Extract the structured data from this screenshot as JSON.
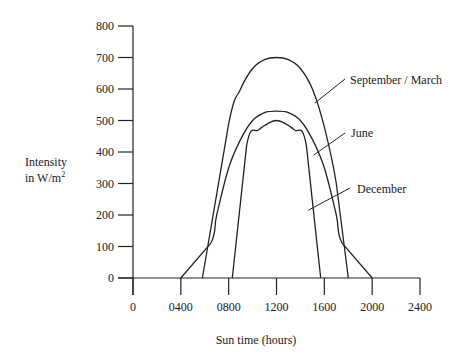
{
  "chart_data": {
    "type": "line",
    "title": "",
    "xlabel": "Sun time (hours)",
    "ylabel_line1": "Intensity",
    "ylabel_line2": "in W/m",
    "ylabel_superscript": "2",
    "xlim": [
      0,
      2400
    ],
    "ylim": [
      0,
      800
    ],
    "x_ticks": [
      0,
      400,
      800,
      1200,
      1600,
      2000,
      2400
    ],
    "x_tick_labels": [
      "0",
      "0400",
      "0800",
      "1200",
      "1600",
      "2000",
      "2400"
    ],
    "y_ticks": [
      0,
      100,
      200,
      300,
      400,
      500,
      600,
      700,
      800
    ],
    "y_tick_labels": [
      "0",
      "100",
      "200",
      "300",
      "400",
      "500",
      "600",
      "700",
      "800"
    ],
    "grid": false,
    "legend": "inline labels with leader lines, right side",
    "series": [
      {
        "name": "September / March",
        "points": [
          [
            580,
            0
          ],
          [
            800,
            490
          ],
          [
            900,
            600
          ],
          [
            1000,
            665
          ],
          [
            1100,
            693
          ],
          [
            1200,
            700
          ],
          [
            1300,
            693
          ],
          [
            1400,
            665
          ],
          [
            1500,
            600
          ],
          [
            1600,
            480
          ],
          [
            1700,
            300
          ],
          [
            1800,
            0
          ]
        ]
      },
      {
        "name": "June",
        "points": [
          [
            400,
            0
          ],
          [
            650,
            110
          ],
          [
            700,
            200
          ],
          [
            800,
            350
          ],
          [
            900,
            440
          ],
          [
            1000,
            500
          ],
          [
            1100,
            525
          ],
          [
            1200,
            530
          ],
          [
            1300,
            525
          ],
          [
            1400,
            500
          ],
          [
            1500,
            440
          ],
          [
            1600,
            350
          ],
          [
            1700,
            200
          ],
          [
            1750,
            110
          ],
          [
            2000,
            0
          ]
        ]
      },
      {
        "name": "December",
        "points": [
          [
            830,
            0
          ],
          [
            950,
            420
          ],
          [
            1050,
            470
          ],
          [
            1150,
            495
          ],
          [
            1200,
            500
          ],
          [
            1250,
            495
          ],
          [
            1350,
            470
          ],
          [
            1450,
            420
          ],
          [
            1570,
            0
          ]
        ]
      }
    ]
  }
}
